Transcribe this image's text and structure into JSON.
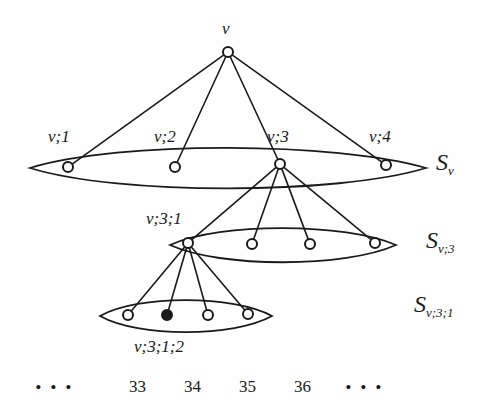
{
  "figure": {
    "type": "tree-diagram",
    "background_color": "#fefefe",
    "ink_color": "#1a1a1a",
    "root_label": "v",
    "node_labels": {
      "level1": [
        "v;1",
        "v;2",
        "v;3",
        "v;4"
      ],
      "level2_first": "v;3;1",
      "level3_marked": "v;3;1;2"
    },
    "set_labels": [
      {
        "base": "S",
        "sub": "v"
      },
      {
        "base": "S",
        "sub": "v;3"
      },
      {
        "base": "S",
        "sub": "v;3;1"
      }
    ],
    "bottom_row": {
      "left_ellipsis": "• • •",
      "numbers": [
        "33",
        "34",
        "35",
        "36"
      ],
      "right_ellipsis": "• • •"
    }
  },
  "chart_data": {
    "type": "diagram",
    "title": "",
    "nodes": [
      {
        "id": "v",
        "label": "v",
        "x": 228,
        "y": 52,
        "filled": false,
        "label_x": 228,
        "label_y": 28
      },
      {
        "id": "v1",
        "label": "v;1",
        "x": 68,
        "y": 167,
        "filled": false,
        "label_x": 70,
        "label_y": 138
      },
      {
        "id": "v2",
        "label": "v;2",
        "x": 175,
        "y": 167,
        "filled": false,
        "label_x": 176,
        "label_y": 138
      },
      {
        "id": "v3",
        "label": "v;3",
        "x": 280,
        "y": 164,
        "filled": false,
        "label_x": 289,
        "label_y": 138
      },
      {
        "id": "v4",
        "label": "v;4",
        "x": 386,
        "y": 165,
        "filled": false,
        "label_x": 391,
        "label_y": 138
      },
      {
        "id": "v31",
        "label": "v;3;1",
        "x": 188,
        "y": 243,
        "filled": false,
        "label_x": 174,
        "label_y": 220
      },
      {
        "id": "v32",
        "label": "",
        "x": 252,
        "y": 244,
        "filled": false
      },
      {
        "id": "v33",
        "label": "",
        "x": 310,
        "y": 244,
        "filled": false
      },
      {
        "id": "v34",
        "label": "",
        "x": 375,
        "y": 243,
        "filled": false
      },
      {
        "id": "v311",
        "label": "",
        "x": 128,
        "y": 315,
        "filled": false
      },
      {
        "id": "v312",
        "label": "v;3;1;2",
        "x": 167,
        "y": 315,
        "filled": true,
        "label_x": 177,
        "label_y": 348
      },
      {
        "id": "v313",
        "label": "",
        "x": 208,
        "y": 315,
        "filled": false
      },
      {
        "id": "v314",
        "label": "",
        "x": 248,
        "y": 314,
        "filled": false
      }
    ],
    "edges": [
      [
        "v",
        "v1"
      ],
      [
        "v",
        "v2"
      ],
      [
        "v",
        "v3"
      ],
      [
        "v",
        "v4"
      ],
      [
        "v3",
        "v31"
      ],
      [
        "v3",
        "v32"
      ],
      [
        "v3",
        "v33"
      ],
      [
        "v3",
        "v34"
      ],
      [
        "v31",
        "v311"
      ],
      [
        "v31",
        "v312"
      ],
      [
        "v31",
        "v313"
      ],
      [
        "v31",
        "v314"
      ]
    ],
    "groups": [
      {
        "id": "Sv",
        "label": "S_v",
        "cx": 228,
        "cy": 168,
        "rx": 198,
        "ry": 19,
        "label_x": 432,
        "label_y": 156
      },
      {
        "id": "Sv3",
        "label": "S_{v;3}",
        "cx": 283,
        "cy": 245,
        "rx": 113,
        "ry": 16,
        "label_x": 424,
        "label_y": 233
      },
      {
        "id": "Sv31",
        "label": "S_{v;3;1}",
        "cx": 186,
        "cy": 316,
        "rx": 86,
        "ry": 15,
        "label_x": 414,
        "label_y": 298
      }
    ]
  }
}
